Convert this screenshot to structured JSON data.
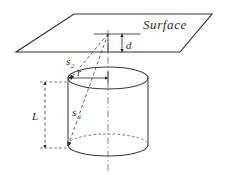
{
  "figure": {
    "background_color": "#ffffff",
    "line_color": "#3a3a3a",
    "dash_color": "#666666",
    "width": 226,
    "height": 175
  },
  "labels": {
    "surface": "Surface",
    "depth": "d",
    "radius": "r",
    "length": "L",
    "ray_lower": "s",
    "ray_lower_sub": "1",
    "ray_upper": "s",
    "ray_upper_sub": "2"
  },
  "geometry": {
    "plane": {
      "name": "surface-plane",
      "points": "16,52 74,14 212,14 180,52"
    },
    "apex": {
      "x": 108,
      "y": 34
    },
    "cylinder": {
      "center_x": 108,
      "top_y": 78,
      "bottom_y": 145,
      "rx": 40,
      "ry": 11
    },
    "dimension_d": {
      "x": 122,
      "y_top": 34,
      "y_bottom": 52
    },
    "dimension_r": {
      "y": 78,
      "x_left": 69,
      "x_right": 108
    },
    "dimension_L": {
      "x": 45,
      "y_top": 82,
      "y_bottom": 148
    }
  }
}
